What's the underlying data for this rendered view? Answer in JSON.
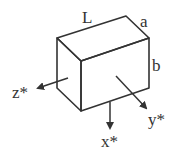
{
  "diagram": {
    "type": "rectangular-block-with-axes",
    "labels": {
      "length": "L",
      "width": "a",
      "height": "b",
      "axis_x": "x*",
      "axis_y": "y*",
      "axis_z": "z*"
    },
    "colors": {
      "stroke": "#333333",
      "background": "#ffffff"
    }
  }
}
